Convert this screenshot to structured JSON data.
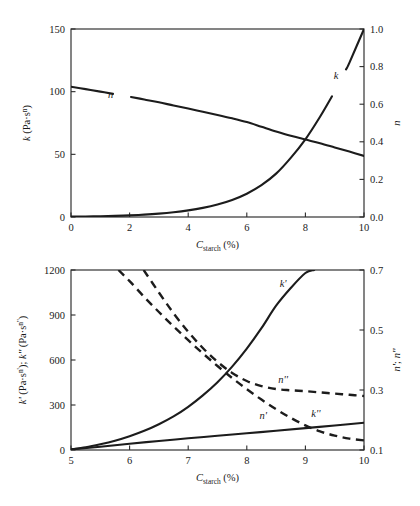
{
  "figure": {
    "name": "two-panel-rheology-figure",
    "background": "#ffffff",
    "line_color": "#1c1c1c"
  },
  "chart_data": [
    {
      "id": "top-panel",
      "type": "line",
      "title": "",
      "xlabel": "C_starch (%)",
      "xlabel_parts": {
        "base": "C",
        "sub": "starch",
        "unit": "(%)"
      },
      "ylabel_left": "k (Pa·sⁿ)",
      "ylabel_left_parts": {
        "symbol": "k",
        "unit_base": "(Pa·s",
        "unit_sup": "n",
        "unit_close": ")"
      },
      "ylabel_right": "n",
      "xlim": [
        0,
        10
      ],
      "ylim_left": [
        0,
        150
      ],
      "ylim_right": [
        0.0,
        1.0
      ],
      "xticks": [
        0,
        2,
        4,
        6,
        8,
        10
      ],
      "xticklabels": [
        "0",
        "2",
        "4",
        "6",
        "8",
        "10"
      ],
      "yticks_left": [
        0,
        50,
        100,
        150
      ],
      "yticklabels_left": [
        "0",
        "50",
        "100",
        "150"
      ],
      "yticks_right": [
        0.0,
        0.2,
        0.4,
        0.6,
        0.8,
        1.0
      ],
      "yticklabels_right": [
        "0.0",
        "0.2",
        "0.4",
        "0.6",
        "0.8",
        "1.0"
      ],
      "grid": false,
      "legend": "inline-curve-labels",
      "series": [
        {
          "name": "k",
          "label": "k",
          "axis": "left",
          "style": "solid",
          "label_x": 9.05,
          "label_y_axis_right": 0.735,
          "x": [
            0,
            0.5,
            1,
            1.5,
            2,
            2.5,
            3,
            3.5,
            4,
            4.5,
            5,
            5.5,
            6,
            6.5,
            7,
            7.5,
            8,
            8.5,
            9,
            9.5,
            10
          ],
          "values": [
            0.3,
            0.4,
            0.6,
            0.9,
            1.3,
            1.9,
            2.7,
            3.8,
            5.3,
            7.3,
            10.0,
            13.6,
            18.6,
            25.4,
            34.6,
            47.2,
            62.0,
            80.0,
            100.0,
            123.0,
            150.0
          ]
        },
        {
          "name": "n",
          "label": "n",
          "axis": "right",
          "style": "solid",
          "label_x": 1.35,
          "label_y_axis_right": 0.635,
          "x": [
            0,
            0.5,
            1,
            1.5,
            2,
            2.5,
            3,
            3.5,
            4,
            4.5,
            5,
            5.5,
            6,
            6.5,
            7,
            7.5,
            8,
            8.5,
            9,
            9.5,
            10
          ],
          "values": [
            0.693,
            0.68,
            0.667,
            0.653,
            0.64,
            0.625,
            0.61,
            0.593,
            0.577,
            0.56,
            0.543,
            0.525,
            0.505,
            0.48,
            0.455,
            0.432,
            0.412,
            0.392,
            0.37,
            0.348,
            0.325
          ]
        }
      ]
    },
    {
      "id": "bottom-panel",
      "type": "line",
      "title": "",
      "xlabel": "C_starch (%)",
      "xlabel_parts": {
        "base": "C",
        "sub": "starch",
        "unit": "(%)"
      },
      "ylabel_left": "k' (Pa·sⁿ'); k'' (Pa·sⁿ'')",
      "ylabel_left_parts": {
        "p1_symbol": "k'",
        "p1_unit_base": "(Pa·s",
        "p1_unit_sup": "n'",
        "p1_close": ")",
        "sep": "; ",
        "p2_symbol": "k''",
        "p2_unit_base": "(Pa·s",
        "p2_unit_sup": "n''",
        "p2_close": ")"
      },
      "ylabel_right": "n'; n''",
      "xlim": [
        5,
        10
      ],
      "ylim_left": [
        0,
        1200
      ],
      "ylim_right": [
        0.1,
        0.7
      ],
      "xticks": [
        5,
        6,
        7,
        8,
        9,
        10
      ],
      "xticklabels": [
        "5",
        "6",
        "7",
        "8",
        "9",
        "10"
      ],
      "yticks_left": [
        0,
        300,
        600,
        900,
        1200
      ],
      "yticklabels_left": [
        "0",
        "300",
        "600",
        "900",
        "1200"
      ],
      "yticks_right": [
        0.1,
        0.3,
        0.5,
        0.7
      ],
      "yticklabels_right": [
        "0.1",
        "0.3",
        "0.5",
        "0.7"
      ],
      "grid": false,
      "legend": "inline-curve-labels",
      "series": [
        {
          "name": "k-prime",
          "label": "k'",
          "axis": "left",
          "style": "solid",
          "label_x": 8.62,
          "label_y_left": 1090,
          "x": [
            5,
            5.25,
            5.5,
            5.75,
            6,
            6.25,
            6.5,
            6.75,
            7,
            7.25,
            7.5,
            7.75,
            8,
            8.25,
            8.5,
            8.75,
            9,
            9.15
          ],
          "values": [
            5,
            18,
            38,
            62,
            92,
            128,
            172,
            224,
            288,
            364,
            452,
            556,
            676,
            812,
            962,
            1080,
            1180,
            1200
          ]
        },
        {
          "name": "k-double-prime",
          "label": "k''",
          "axis": "left",
          "style": "solid",
          "label_x": 9.18,
          "label_y_left": 222,
          "x": [
            5,
            5.5,
            6,
            6.5,
            7,
            7.5,
            8,
            8.5,
            9,
            9.5,
            10
          ],
          "values": [
            4,
            22,
            42,
            60,
            78,
            95,
            112,
            128,
            146,
            163,
            182
          ]
        },
        {
          "name": "n-prime",
          "label": "n'",
          "axis": "right",
          "style": "dashed",
          "label_x": 8.28,
          "label_y_right": 0.203,
          "x": [
            5.81,
            6,
            6.25,
            6.5,
            6.75,
            7,
            7.25,
            7.5,
            7.75,
            8,
            8.25,
            8.5,
            8.75,
            9,
            9.25,
            9.5,
            9.75,
            10
          ],
          "values": [
            0.7,
            0.663,
            0.61,
            0.56,
            0.512,
            0.466,
            0.422,
            0.38,
            0.34,
            0.303,
            0.268,
            0.236,
            0.207,
            0.182,
            0.162,
            0.148,
            0.138,
            0.132
          ]
        },
        {
          "name": "n-double-prime",
          "label": "n''",
          "axis": "right",
          "style": "dashed",
          "label_x": 8.62,
          "label_y_right": 0.322,
          "x": [
            6.24,
            6.5,
            6.75,
            7,
            7.25,
            7.5,
            7.75,
            8,
            8.25,
            8.5,
            8.75,
            9,
            9.25,
            9.5,
            9.75,
            10
          ],
          "values": [
            0.7,
            0.625,
            0.556,
            0.494,
            0.44,
            0.394,
            0.357,
            0.33,
            0.313,
            0.303,
            0.299,
            0.296,
            0.292,
            0.288,
            0.284,
            0.28
          ]
        }
      ]
    }
  ]
}
